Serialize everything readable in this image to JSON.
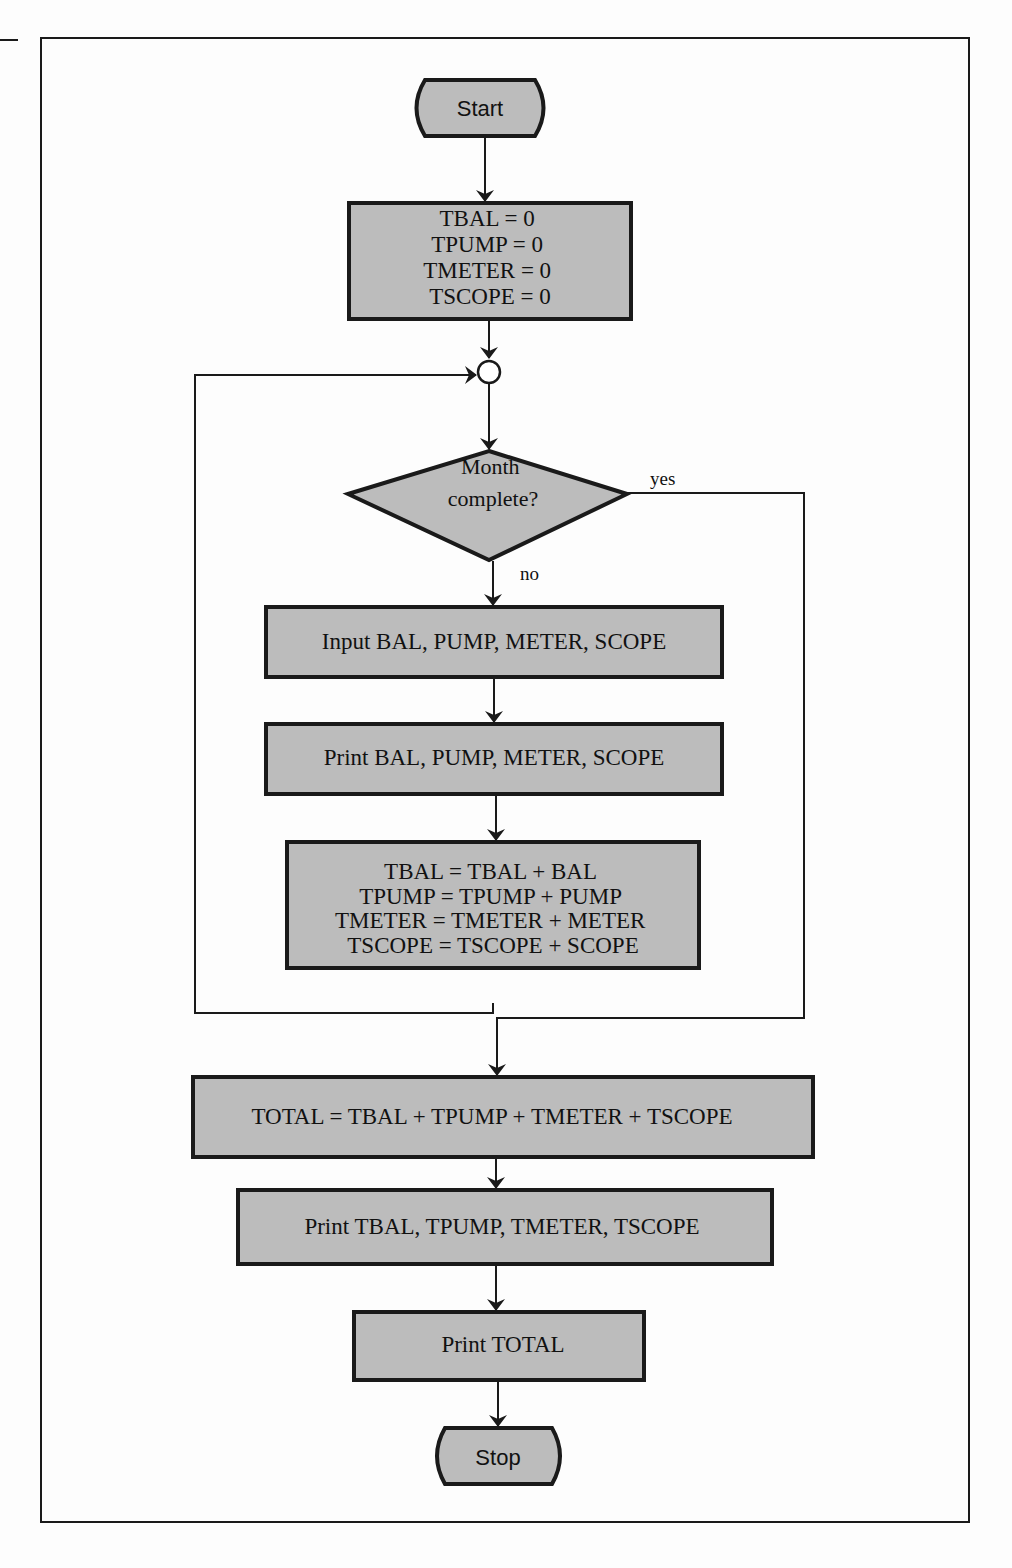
{
  "diagram": {
    "type": "flowchart",
    "colors": {
      "fill": "#bcbcbc",
      "stroke": "#1a1a1a",
      "background": "#fdfdfd"
    },
    "start": {
      "label": "Start"
    },
    "init": {
      "lines": [
        "TBAL = 0",
        "TPUMP = 0",
        "TMETER = 0",
        "TSCOPE = 0"
      ]
    },
    "decision": {
      "lines": [
        "Month",
        "complete?"
      ],
      "yes_label": "yes",
      "no_label": "no"
    },
    "input": {
      "label": "Input BAL, PUMP, METER, SCOPE"
    },
    "print_items": {
      "label": "Print BAL, PUMP, METER, SCOPE"
    },
    "accumulate": {
      "lines": [
        "TBAL = TBAL + BAL",
        "TPUMP = TPUMP + PUMP",
        "TMETER = TMETER + METER",
        "TSCOPE = TSCOPE + SCOPE"
      ]
    },
    "total": {
      "label": "TOTAL = TBAL + TPUMP + TMETER + TSCOPE"
    },
    "print_totals": {
      "label": "Print TBAL, TPUMP, TMETER, TSCOPE"
    },
    "print_total": {
      "label": "Print TOTAL"
    },
    "stop": {
      "label": "Stop"
    }
  }
}
